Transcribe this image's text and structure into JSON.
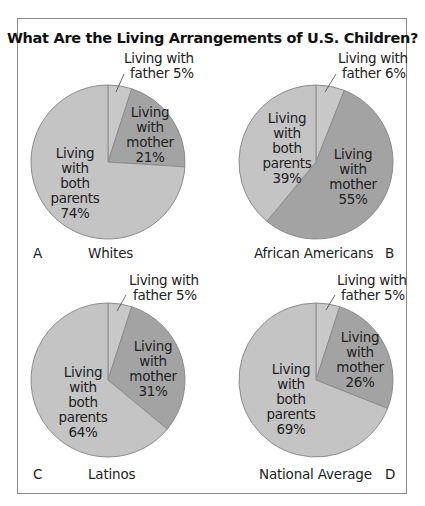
{
  "title": "What Are the Living Arrangements of U.S. Children?",
  "colors": {
    "father": "#c8c8c8",
    "mother": "#a3a3a3",
    "both": "#c4c4c4",
    "stroke": "#8c8c8c"
  },
  "panels": [
    {
      "letter": "A",
      "group": "Whites",
      "father": {
        "line1": "Living with",
        "line2": "father 5%"
      },
      "mother": {
        "l1": "Living",
        "l2": "with",
        "l3": "mother",
        "l4": "21%"
      },
      "both": {
        "l1": "Living",
        "l2": "with",
        "l3": "both",
        "l4": "parents",
        "l5": "74%"
      }
    },
    {
      "letter": "B",
      "group": "African Americans",
      "father": {
        "line1": "Living with",
        "line2": "father 6%"
      },
      "mother": {
        "l1": "Living",
        "l2": "with",
        "l3": "mother",
        "l4": "55%"
      },
      "both": {
        "l1": "Living",
        "l2": "with",
        "l3": "both",
        "l4": "parents",
        "l5": "39%"
      }
    },
    {
      "letter": "C",
      "group": "Latinos",
      "father": {
        "line1": "Living with",
        "line2": "father 5%"
      },
      "mother": {
        "l1": "Living",
        "l2": "with",
        "l3": "mother",
        "l4": "31%"
      },
      "both": {
        "l1": "Living",
        "l2": "with",
        "l3": "both",
        "l4": "parents",
        "l5": "64%"
      }
    },
    {
      "letter": "D",
      "group": "National Average",
      "father": {
        "line1": "Living with",
        "line2": "father 5%"
      },
      "mother": {
        "l1": "Living",
        "l2": "with",
        "l3": "mother",
        "l4": "26%"
      },
      "both": {
        "l1": "Living",
        "l2": "with",
        "l3": "both",
        "l4": "parents",
        "l5": "69%"
      }
    }
  ],
  "chart_data": [
    {
      "type": "pie",
      "title": "Whites",
      "panel": "A",
      "categories": [
        "Living with father",
        "Living with mother",
        "Living with both parents"
      ],
      "values": [
        5,
        21,
        74
      ]
    },
    {
      "type": "pie",
      "title": "African Americans",
      "panel": "B",
      "categories": [
        "Living with father",
        "Living with mother",
        "Living with both parents"
      ],
      "values": [
        6,
        55,
        39
      ]
    },
    {
      "type": "pie",
      "title": "Latinos",
      "panel": "C",
      "categories": [
        "Living with father",
        "Living with mother",
        "Living with both parents"
      ],
      "values": [
        5,
        31,
        64
      ]
    },
    {
      "type": "pie",
      "title": "National Average",
      "panel": "D",
      "categories": [
        "Living with father",
        "Living with mother",
        "Living with both parents"
      ],
      "values": [
        5,
        26,
        69
      ]
    }
  ]
}
